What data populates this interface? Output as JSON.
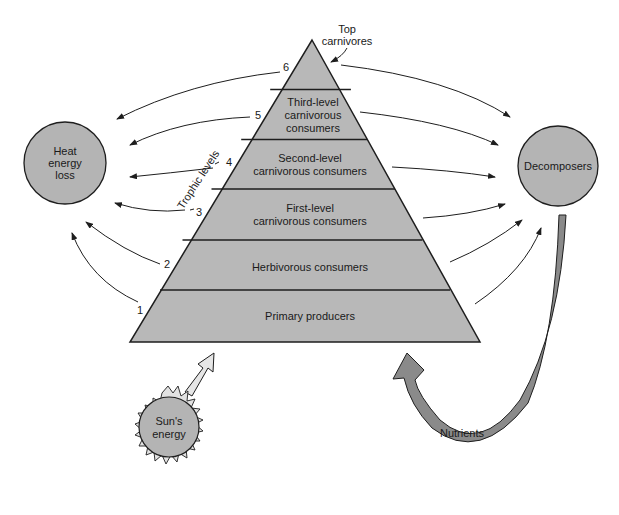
{
  "diagram": {
    "colors": {
      "pyramid_fill": "#b8b8b8",
      "circle_fill": "#b4b4b4",
      "nutrient_arrow": "#8a8a8a",
      "sun_rays": "#e2e2e2",
      "sun_arrow": "#e6e6e6",
      "stroke": "#1e1e1e"
    },
    "pyramid": {
      "top_label_line1": "Top",
      "top_label_line2": "carnivores",
      "levels": [
        {
          "number": "1",
          "line1": "Primary producers",
          "line2": "",
          "line3": ""
        },
        {
          "number": "2",
          "line1": "Herbivorous consumers",
          "line2": "",
          "line3": ""
        },
        {
          "number": "3",
          "line1": "First-level",
          "line2": "carnivorous consumers",
          "line3": ""
        },
        {
          "number": "4",
          "line1": "Second-level",
          "line2": "carnivorous consumers",
          "line3": ""
        },
        {
          "number": "5",
          "line1": "Third-level",
          "line2": "carnivorous",
          "line3": "consumers"
        },
        {
          "number": "6",
          "line1": "",
          "line2": "",
          "line3": ""
        }
      ],
      "axis_label": "Trophic levels"
    },
    "heat_loss": {
      "line1": "Heat",
      "line2": "energy",
      "line3": "loss"
    },
    "decomposers": {
      "label": "Decomposers"
    },
    "sun": {
      "line1": "Sun's",
      "line2": "energy"
    },
    "nutrients": {
      "label": "Nutrients"
    }
  }
}
